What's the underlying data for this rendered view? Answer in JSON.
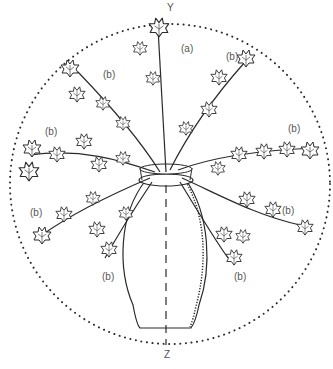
{
  "diagram": {
    "axis": {
      "top_label": "Y",
      "bottom_label": "Z"
    },
    "labels": [
      {
        "id": "a",
        "text": "(a)",
        "x": 181,
        "y": 44
      },
      {
        "id": "b1",
        "text": "(b)",
        "x": 226,
        "y": 52
      },
      {
        "id": "b2",
        "text": "(b)",
        "x": 103,
        "y": 70
      },
      {
        "id": "b3",
        "text": "(b)",
        "x": 45,
        "y": 127
      },
      {
        "id": "b4",
        "text": "(b)",
        "x": 288,
        "y": 124
      },
      {
        "id": "b5",
        "text": "(b)",
        "x": 30,
        "y": 208
      },
      {
        "id": "b6",
        "text": "(b)",
        "x": 282,
        "y": 206
      },
      {
        "id": "b7",
        "text": "(b)",
        "x": 102,
        "y": 272
      },
      {
        "id": "b8",
        "text": "(b)",
        "x": 234,
        "y": 272
      }
    ],
    "colors": {
      "line": "#2a2a2a",
      "label": "#555555",
      "background": "#ffffff"
    }
  }
}
